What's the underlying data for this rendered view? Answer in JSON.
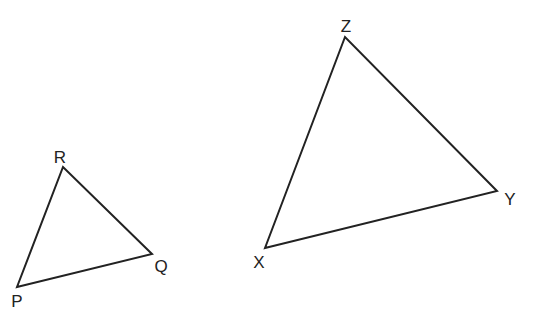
{
  "diagram": {
    "type": "similar-triangles",
    "stroke_color": "#222222",
    "background": "#ffffff",
    "top_cutoff_text": "",
    "triangles": [
      {
        "name": "PQR",
        "vertices": [
          {
            "label": "P",
            "x": 17,
            "y": 287,
            "label_x": 17,
            "label_y": 301
          },
          {
            "label": "Q",
            "x": 152,
            "y": 254,
            "label_x": 161,
            "label_y": 266
          },
          {
            "label": "R",
            "x": 63,
            "y": 167,
            "label_x": 60,
            "label_y": 157
          }
        ]
      },
      {
        "name": "XYZ",
        "vertices": [
          {
            "label": "X",
            "x": 265,
            "y": 248,
            "label_x": 259,
            "label_y": 262
          },
          {
            "label": "Y",
            "x": 497,
            "y": 191,
            "label_x": 510,
            "label_y": 199
          },
          {
            "label": "Z",
            "x": 345,
            "y": 37,
            "label_x": 346,
            "label_y": 26
          }
        ]
      }
    ]
  }
}
